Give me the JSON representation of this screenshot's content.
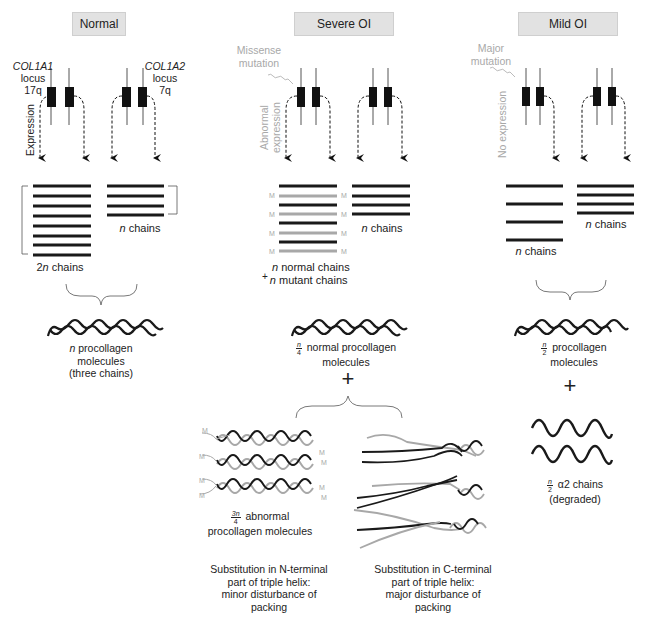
{
  "headers": {
    "normal": "Normal",
    "severe": "Severe OI",
    "mild": "Mild OI"
  },
  "normal": {
    "col1a1": {
      "gene": "COL1A1",
      "word": "locus",
      "loc": "17q"
    },
    "col1a2": {
      "gene": "COL1A2",
      "word": "locus",
      "loc": "7q"
    },
    "expression_label": "Expression",
    "left_chains_n": "2",
    "left_chains_var": "n",
    "left_chains_word": " chains",
    "right_chains_var": "n",
    "right_chains_word": " chains",
    "molecule_var": "n",
    "molecule_line1": " procollagen",
    "molecule_line2": "molecules",
    "molecule_line3": "(three chains)"
  },
  "severe": {
    "mutation_line1": "Missense",
    "mutation_line2": "mutation",
    "expression_line1": "Abnormal",
    "expression_line2": "expression",
    "mutant_marker": "M",
    "right_chains_var": "n",
    "right_chains_word": " chains",
    "mix_plus": "+",
    "mix_line1_var": "n",
    "mix_line1": " normal chains",
    "mix_line2_var": "n",
    "mix_line2": " mutant chains",
    "normal_frac_num": "n",
    "normal_frac_den": "4",
    "normal_mol_line1": " normal procollagen",
    "normal_mol_line2": "molecules",
    "plus": "+",
    "abnormal_frac_num": "3n",
    "abnormal_frac_den": "4",
    "abnormal_line1": " abnormal",
    "abnormal_line2": "procollagen molecules",
    "n_terminal": [
      "Substitution in N-terminal",
      "part of triple helix:",
      "minor disturbance of",
      "packing"
    ],
    "c_terminal": [
      "Substitution in C-terminal",
      "part of triple helix:",
      "major disturbance of",
      "packing"
    ]
  },
  "mild": {
    "mutation_line1": "Major",
    "mutation_line2": "mutation",
    "expression_label": "No expression",
    "left_chains_var": "n",
    "left_chains_word": " chains",
    "right_chains_var": "n",
    "right_chains_word": " chains",
    "frac_num": "n",
    "frac_den": "2",
    "mol_line1": " procollagen",
    "mol_line2": "molecules",
    "plus": "+",
    "degraded_frac_num": "n",
    "degraded_frac_den": "2",
    "degraded_label": " α2 chains (degraded)"
  },
  "colors": {
    "header_bg": "#e2e2e2",
    "normal_chain": "#1a1a1a",
    "mutant_chain": "#a8a8a8",
    "label_gray": "#a8a8a8"
  }
}
